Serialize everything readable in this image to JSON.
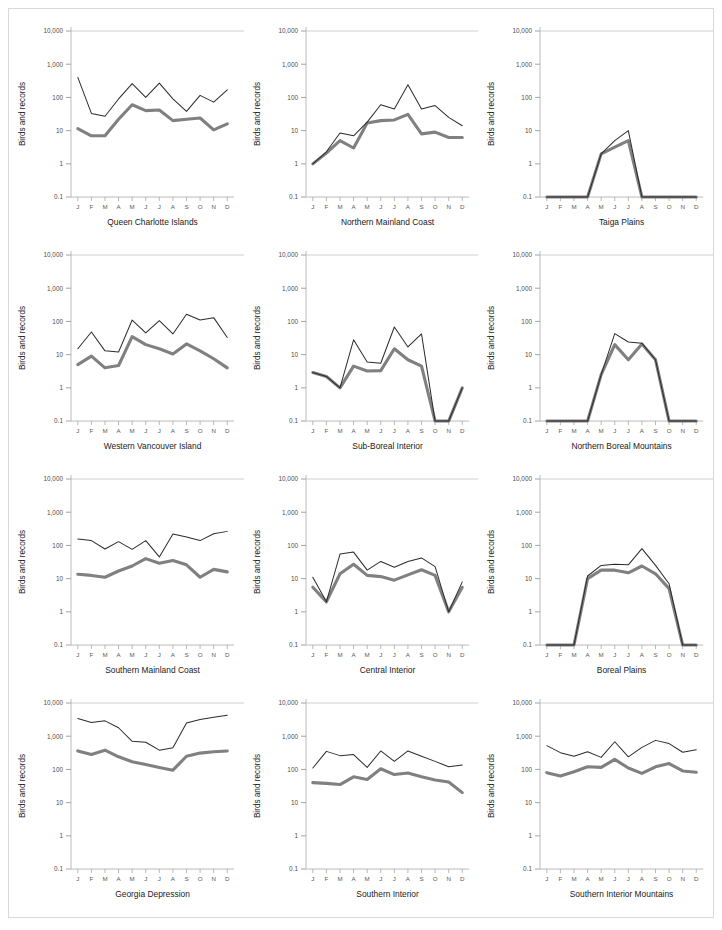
{
  "figure": {
    "y_axis_label": "Birds and records",
    "y_ticks": [
      "10,000",
      "1,000",
      "100",
      "10",
      "1",
      "0.1"
    ],
    "y_tick_values": [
      10000,
      1000,
      100,
      10,
      1,
      0.1
    ],
    "ylim": [
      0.1,
      10000
    ],
    "x_ticks": [
      "J",
      "F",
      "M",
      "A",
      "M",
      "J",
      "J",
      "A",
      "S",
      "O",
      "N",
      "D"
    ],
    "series_colors": {
      "records": "#2b2b2b",
      "birds": "#808080"
    },
    "grid": "single horizontal gridline at 10,000",
    "caption": ""
  },
  "chart_data": {
    "type": "line",
    "title": "",
    "xlabel": "",
    "ylabel": "Birds and records",
    "ylim": [
      0.1,
      10000
    ],
    "yscale": "log",
    "x": [
      "J",
      "F",
      "M",
      "A",
      "M",
      "J",
      "J",
      "A",
      "S",
      "O",
      "N",
      "D"
    ],
    "legend": [
      "records",
      "birds"
    ],
    "legend_position": "none",
    "panels": [
      {
        "title": "Queen Charlotte Islands",
        "series": [
          {
            "name": "records",
            "values": [
              400,
              33,
              27,
              90,
              260,
              100,
              270,
              90,
              38,
              115,
              72,
              170
            ]
          },
          {
            "name": "birds",
            "values": [
              11.5,
              7,
              7,
              22,
              60,
              40,
              42,
              20,
              22,
              24,
              10.5,
              16
            ]
          }
        ]
      },
      {
        "title": "Northern Mainland Coast",
        "series": [
          {
            "name": "records",
            "values": [
              1,
              2.3,
              8.5,
              7,
              18,
              60,
              45,
              240,
              45,
              57,
              25,
              14
            ]
          },
          {
            "name": "birds",
            "values": [
              1,
              2.1,
              5,
              3,
              17,
              20,
              21,
              31,
              8,
              9,
              6.2,
              6.2
            ]
          }
        ]
      },
      {
        "title": "Taiga Plains",
        "series": [
          {
            "name": "records",
            "values": [
              0.1,
              0.1,
              0.1,
              0.1,
              2,
              5,
              10,
              0.1,
              0.1,
              0.1,
              0.1,
              0.1
            ]
          },
          {
            "name": "birds",
            "values": [
              0.1,
              0.1,
              0.1,
              0.1,
              2,
              3.2,
              5,
              0.1,
              0.1,
              0.1,
              0.1,
              0.1
            ]
          }
        ]
      },
      {
        "title": "Western Vancouver Island",
        "series": [
          {
            "name": "records",
            "values": [
              15,
              48,
              13,
              12,
              110,
              45,
              105,
              42,
              165,
              110,
              130,
              33
            ]
          },
          {
            "name": "birds",
            "values": [
              5,
              9,
              4,
              4.7,
              35,
              20,
              15,
              10.5,
              21,
              13,
              7.5,
              4
            ]
          }
        ]
      },
      {
        "title": "Sub-Boreal Interior",
        "series": [
          {
            "name": "records",
            "values": [
              2.9,
              2.2,
              1,
              28,
              6,
              5.5,
              68,
              17,
              42,
              0.1,
              0.1,
              1
            ]
          },
          {
            "name": "birds",
            "values": [
              2.9,
              2.2,
              1,
              4.5,
              3.2,
              3.3,
              15,
              7,
              4.5,
              0.1,
              0.1,
              1
            ]
          }
        ]
      },
      {
        "title": "Northern Boreal Mountains",
        "series": [
          {
            "name": "records",
            "values": [
              0.1,
              0.1,
              0.1,
              0.1,
              2.5,
              43,
              24,
              22,
              7,
              0.1,
              0.1,
              0.1
            ]
          },
          {
            "name": "birds",
            "values": [
              0.1,
              0.1,
              0.1,
              0.1,
              2.5,
              20,
              7,
              21,
              7,
              0.1,
              0.1,
              0.1
            ]
          }
        ]
      },
      {
        "title": "Southern Mainland Coast",
        "series": [
          {
            "name": "records",
            "values": [
              155,
              140,
              78,
              130,
              76,
              140,
              45,
              220,
              180,
              140,
              225,
              265
            ]
          },
          {
            "name": "birds",
            "values": [
              13.5,
              12.5,
              11,
              17,
              24,
              40,
              29,
              35,
              26,
              11,
              19,
              16
            ]
          }
        ]
      },
      {
        "title": "Central Interior",
        "series": [
          {
            "name": "records",
            "values": [
              11,
              2,
              55,
              63,
              18,
              33,
              22,
              33,
              42,
              23,
              1,
              8
            ]
          },
          {
            "name": "birds",
            "values": [
              5.5,
              2,
              14,
              27,
              12.5,
              11.5,
              9,
              13,
              18.5,
              12.5,
              1,
              5.5
            ]
          }
        ]
      },
      {
        "title": "Boreal Plains",
        "series": [
          {
            "name": "records",
            "values": [
              0.1,
              0.1,
              0.1,
              12,
              25,
              27,
              26,
              80,
              25,
              7,
              0.1,
              0.1
            ]
          },
          {
            "name": "birds",
            "values": [
              0.1,
              0.1,
              0.1,
              10,
              18,
              18,
              15,
              24,
              14,
              5,
              0.1,
              0.1
            ]
          }
        ]
      },
      {
        "title": "Georgia Depression",
        "series": [
          {
            "name": "records",
            "values": [
              3400,
              2600,
              2900,
              1800,
              700,
              660,
              380,
              450,
              2500,
              3200,
              3700,
              4300
            ]
          },
          {
            "name": "birds",
            "values": [
              360,
              280,
              380,
              240,
              170,
              140,
              115,
              95,
              250,
              310,
              340,
              360
            ]
          }
        ]
      },
      {
        "title": "Southern Interior",
        "series": [
          {
            "name": "records",
            "values": [
              110,
              350,
              260,
              280,
              115,
              360,
              175,
              360,
              250,
              175,
              120,
              135
            ]
          },
          {
            "name": "birds",
            "values": [
              40,
              38,
              35,
              60,
              50,
              105,
              70,
              78,
              60,
              48,
              42,
              20
            ]
          }
        ]
      },
      {
        "title": "Southern Interior Mountains",
        "series": [
          {
            "name": "records",
            "values": [
              520,
              320,
              250,
              340,
              230,
              680,
              240,
              460,
              750,
              600,
              330,
              390
            ]
          },
          {
            "name": "birds",
            "values": [
              80,
              63,
              85,
              120,
              115,
              200,
              110,
              76,
              120,
              150,
              90,
              82
            ]
          }
        ]
      }
    ]
  }
}
